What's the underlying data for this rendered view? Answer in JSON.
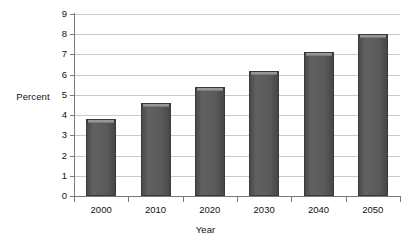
{
  "chart_data": {
    "type": "bar",
    "title": "",
    "categories": [
      "2000",
      "2010",
      "2020",
      "2030",
      "2040",
      "2050"
    ],
    "values": [
      3.8,
      4.6,
      5.4,
      6.2,
      7.1,
      8.0
    ],
    "xlabel": "Year",
    "ylabel": "Percent",
    "ylim": [
      0,
      9
    ],
    "ytick_labels": [
      "0",
      "1",
      "2",
      "3",
      "4",
      "5",
      "6",
      "7",
      "8",
      "9"
    ],
    "ytick_values": [
      0,
      1,
      2,
      3,
      4,
      5,
      6,
      7,
      8,
      9
    ],
    "grid": true,
    "legend": false,
    "legend_position": "none",
    "bar_color": "#5a5a5a",
    "bar_edge_color": "#3a3a3a",
    "bar_highlight_color": "#a2a2a2",
    "gridline_color": "#c9c9c9",
    "axis_color": "#7a7a7a",
    "background_color": "#ffffff",
    "text_color": "#111111"
  }
}
